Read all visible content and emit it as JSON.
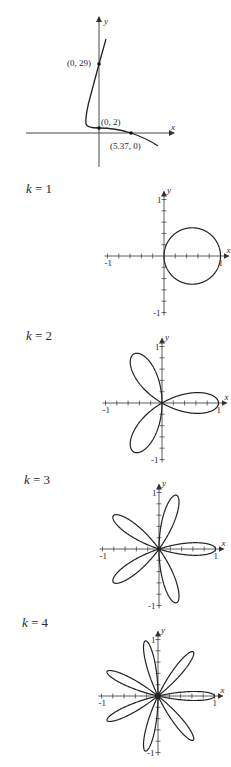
{
  "chart_data": [
    {
      "type": "line",
      "title": "",
      "xlabel": "x",
      "ylabel": "y",
      "description": "Curve passing through labeled points, crossing y-axis twice and x-axis once",
      "annotations": [
        {
          "label": "(0, 29)",
          "x": 0,
          "y": 29
        },
        {
          "label": "(0, 2)",
          "x": 0,
          "y": 2
        },
        {
          "label": "(5.37, 0)",
          "x": 5.37,
          "y": 0
        }
      ],
      "grid": false,
      "legend": null
    },
    {
      "type": "line",
      "subtype": "polar",
      "label": "k = 1",
      "k": 1,
      "petals": 1,
      "equation_form": "r = cos((2k-1)θ)",
      "xlabel": "x",
      "ylabel": "y",
      "xlim": [
        -1,
        1
      ],
      "ylim": [
        -1,
        1
      ],
      "x_tick_labels": [
        "-1",
        "1"
      ],
      "y_tick_labels": [
        "1",
        "-1"
      ],
      "tick_step": 0.2,
      "grid": false
    },
    {
      "type": "line",
      "subtype": "polar",
      "label": "k = 2",
      "k": 2,
      "petals": 3,
      "equation_form": "r = cos((2k-1)θ)",
      "xlabel": "x",
      "ylabel": "y",
      "xlim": [
        -1,
        1
      ],
      "ylim": [
        -1,
        1
      ],
      "x_tick_labels": [
        "-1",
        "1"
      ],
      "y_tick_labels": [
        "1",
        "-1"
      ],
      "tick_step": 0.2,
      "grid": false
    },
    {
      "type": "line",
      "subtype": "polar",
      "label": "k = 3",
      "k": 3,
      "petals": 5,
      "equation_form": "r = cos((2k-1)θ)",
      "xlabel": "x",
      "ylabel": "y",
      "xlim": [
        -1,
        1
      ],
      "ylim": [
        -1,
        1
      ],
      "x_tick_labels": [
        "-1",
        "1"
      ],
      "y_tick_labels": [
        "1",
        "-1"
      ],
      "tick_step": 0.2,
      "grid": false
    },
    {
      "type": "line",
      "subtype": "polar",
      "label": "k = 4",
      "k": 4,
      "petals": 7,
      "equation_form": "r = cos((2k-1)θ)",
      "xlabel": "x",
      "ylabel": "y",
      "xlim": [
        -1,
        1
      ],
      "ylim": [
        -1,
        1
      ],
      "x_tick_labels": [
        "-1",
        "1"
      ],
      "y_tick_labels": [
        "1",
        "-1"
      ],
      "tick_step": 0.2,
      "grid": false
    }
  ],
  "labels": {
    "k1": {
      "var": "k",
      "rest": " = 1"
    },
    "k2": {
      "var": "k",
      "rest": " = 2"
    },
    "k3": {
      "var": "k",
      "rest": " = 3"
    },
    "k4": {
      "var": "k",
      "rest": " = 4"
    }
  },
  "colors": {
    "ink": "#222222",
    "axis": "#333333"
  }
}
